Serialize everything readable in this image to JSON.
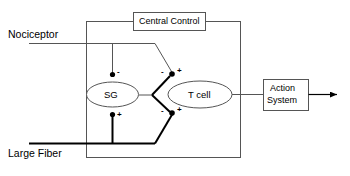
{
  "diagram": {
    "colors": {
      "stroke_thin": "#555555",
      "stroke_bold": "#000000",
      "text": "#000000",
      "background": "#ffffff"
    },
    "inputs": [
      {
        "id": "nociceptor",
        "label": "Nociceptor",
        "line_weight": "thin"
      },
      {
        "id": "large-fiber",
        "label": "Large Fiber",
        "line_weight": "bold"
      }
    ],
    "nodes": [
      {
        "id": "central-control",
        "label": "Central Control",
        "shape": "rectangle"
      },
      {
        "id": "sg",
        "label": "SG",
        "shape": "ellipse"
      },
      {
        "id": "t-cell",
        "label": "T cell",
        "shape": "ellipse"
      },
      {
        "id": "action-system",
        "label_line1": "Action",
        "label_line2": "System",
        "shape": "rectangle"
      }
    ],
    "synapse_signs": {
      "sg_top": "-",
      "sg_bottom": "+",
      "tcell_upper_left": "-",
      "tcell_upper_right": "+",
      "tcell_lower_left": "-",
      "tcell_lower_right": "+"
    },
    "output": {
      "id": "output-arrow",
      "label": ""
    }
  }
}
